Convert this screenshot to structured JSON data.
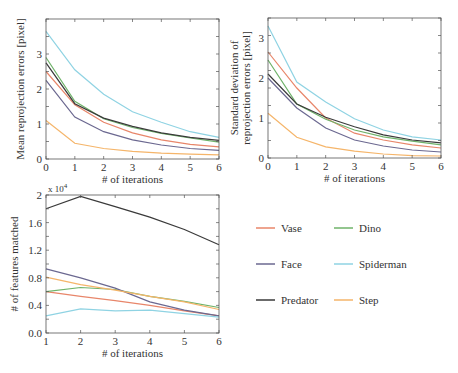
{
  "series_styles": [
    {
      "name": "Vase",
      "color": "#e8866a"
    },
    {
      "name": "Dino",
      "color": "#6fb36a"
    },
    {
      "name": "Face",
      "color": "#6b6890"
    },
    {
      "name": "Spiderman",
      "color": "#8fd3e3"
    },
    {
      "name": "Predator",
      "color": "#3a3a3a"
    },
    {
      "name": "Step",
      "color": "#f5b56a"
    }
  ],
  "legend": {
    "items": [
      {
        "label": "Vase",
        "color": "#e8866a"
      },
      {
        "label": "Dino",
        "color": "#6fb36a"
      },
      {
        "label": "Face",
        "color": "#6b6890"
      },
      {
        "label": "Spiderman",
        "color": "#8fd3e3"
      },
      {
        "label": "Predator",
        "color": "#3a3a3a"
      },
      {
        "label": "Step",
        "color": "#f5b56a"
      }
    ]
  },
  "chart_data": [
    {
      "type": "line",
      "title": "",
      "xlabel": "# of iterations",
      "ylabel": "Mean reprojection errors [pixel]",
      "x": [
        0,
        1,
        2,
        3,
        4,
        5,
        6
      ],
      "xticks": [
        "0",
        "1",
        "2",
        "3",
        "4",
        "5",
        "6"
      ],
      "yticks": [
        "0",
        "1",
        "2",
        "3"
      ],
      "xlim": [
        0,
        6
      ],
      "ylim": [
        0,
        4
      ],
      "grid": false,
      "series": [
        {
          "name": "Vase",
          "values": [
            2.5,
            1.55,
            1.05,
            0.75,
            0.55,
            0.42,
            0.35
          ]
        },
        {
          "name": "Dino",
          "values": [
            2.9,
            1.65,
            1.15,
            0.9,
            0.73,
            0.6,
            0.48
          ]
        },
        {
          "name": "Face",
          "values": [
            2.25,
            1.2,
            0.78,
            0.55,
            0.4,
            0.3,
            0.25
          ]
        },
        {
          "name": "Spiderman",
          "values": [
            3.65,
            2.55,
            1.85,
            1.35,
            1.05,
            0.78,
            0.62
          ]
        },
        {
          "name": "Predator",
          "values": [
            2.75,
            1.58,
            1.17,
            0.93,
            0.75,
            0.62,
            0.53
          ]
        },
        {
          "name": "Step",
          "values": [
            1.1,
            0.45,
            0.3,
            0.22,
            0.17,
            0.14,
            0.12
          ]
        }
      ]
    },
    {
      "type": "line",
      "title": "",
      "xlabel": "# of iterations",
      "ylabel": "Standard deviation of reprojection errors [pixel]",
      "ylabel_lines": [
        "Standard deviation of",
        "reprojection errors [pixel]"
      ],
      "x": [
        0,
        1,
        2,
        3,
        4,
        5,
        6
      ],
      "xticks": [
        "0",
        "1",
        "2",
        "3",
        "4",
        "5",
        "6"
      ],
      "yticks": [
        "0",
        "1",
        "2",
        "3"
      ],
      "xlim": [
        0,
        6
      ],
      "ylim": [
        0,
        3.5
      ],
      "grid": false,
      "series": [
        {
          "name": "Vase",
          "values": [
            2.65,
            1.75,
            1.0,
            0.62,
            0.45,
            0.33,
            0.25
          ]
        },
        {
          "name": "Dino",
          "values": [
            2.45,
            1.35,
            0.97,
            0.7,
            0.53,
            0.42,
            0.33
          ]
        },
        {
          "name": "Face",
          "values": [
            2.0,
            1.25,
            0.75,
            0.45,
            0.3,
            0.2,
            0.15
          ]
        },
        {
          "name": "Spiderman",
          "values": [
            3.3,
            1.9,
            1.4,
            0.98,
            0.7,
            0.53,
            0.45
          ]
        },
        {
          "name": "Predator",
          "values": [
            2.1,
            1.35,
            1.02,
            0.78,
            0.58,
            0.45,
            0.38
          ]
        },
        {
          "name": "Step",
          "values": [
            1.12,
            0.52,
            0.28,
            0.17,
            0.1,
            0.06,
            0.05
          ]
        }
      ]
    },
    {
      "type": "line",
      "title": "",
      "xlabel": "# of iterations",
      "ylabel": "# of features matched",
      "y_multiplier": "x 10^4",
      "x": [
        1,
        2,
        3,
        4,
        5,
        6
      ],
      "xticks": [
        "1",
        "2",
        "3",
        "4",
        "5",
        "6"
      ],
      "yticks": [
        "0.0",
        "0.4",
        "0.8",
        "1.2",
        "1.6",
        "2"
      ],
      "xlim": [
        1,
        6
      ],
      "ylim": [
        0,
        2
      ],
      "grid": false,
      "series": [
        {
          "name": "Vase",
          "values": [
            0.6,
            0.53,
            0.47,
            0.4,
            0.32,
            0.25
          ]
        },
        {
          "name": "Dino",
          "values": [
            0.6,
            0.66,
            0.63,
            0.53,
            0.46,
            0.37
          ]
        },
        {
          "name": "Face",
          "values": [
            0.93,
            0.8,
            0.65,
            0.45,
            0.33,
            0.25
          ]
        },
        {
          "name": "Spiderman",
          "values": [
            0.25,
            0.35,
            0.32,
            0.33,
            0.28,
            0.23
          ]
        },
        {
          "name": "Predator",
          "values": [
            1.8,
            1.98,
            1.83,
            1.68,
            1.5,
            1.28
          ]
        },
        {
          "name": "Step",
          "values": [
            0.81,
            0.7,
            0.62,
            0.53,
            0.45,
            0.34
          ]
        }
      ]
    }
  ],
  "charts_layout": [
    {
      "left": 46,
      "right": 219,
      "top": 19,
      "bottom": 159
    },
    {
      "left": 268,
      "right": 441,
      "top": 18,
      "bottom": 158
    },
    {
      "left": 46,
      "right": 219,
      "top": 195,
      "bottom": 333
    }
  ],
  "legend_layout": {
    "col_x": [
      256,
      334
    ],
    "row_y": [
      228,
      264,
      300
    ]
  }
}
